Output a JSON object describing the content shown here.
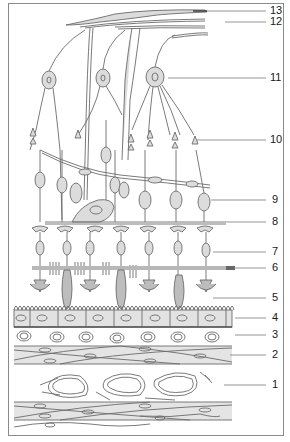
{
  "diagram": {
    "colors": {
      "frame": "#8a8a8a",
      "outline": "#6b6b6b",
      "fill": "#dcdcdc",
      "fill_dark": "#bdbdbd",
      "leader": "#7a7a7a",
      "band": "#9a9a9a",
      "band_dark": "#555555",
      "text": "#1a1a1a"
    },
    "labels": [
      {
        "id": "13",
        "text": "13",
        "y": 11,
        "line_from_x": 207
      },
      {
        "id": "12",
        "text": "12",
        "y": 22,
        "line_from_x": 225
      },
      {
        "id": "11",
        "text": "11",
        "y": 78,
        "line_from_x": 168
      },
      {
        "id": "10",
        "text": "10",
        "y": 140,
        "line_from_x": 197
      },
      {
        "id": "9",
        "text": "9",
        "y": 200,
        "line_from_x": 211
      },
      {
        "id": "8",
        "text": "8",
        "y": 222,
        "line_from_x": 226
      },
      {
        "id": "7",
        "text": "7",
        "y": 252,
        "line_from_x": 213
      },
      {
        "id": "6",
        "text": "6",
        "y": 268,
        "line_from_x": 233
      },
      {
        "id": "5",
        "text": "5",
        "y": 298,
        "line_from_x": 213
      },
      {
        "id": "4",
        "text": "4",
        "y": 318,
        "line_from_x": 235
      },
      {
        "id": "3",
        "text": "3",
        "y": 335,
        "line_from_x": 235
      },
      {
        "id": "2",
        "text": "2",
        "y": 355,
        "line_from_x": 230
      },
      {
        "id": "1",
        "text": "1",
        "y": 385,
        "line_from_x": 224
      }
    ]
  }
}
